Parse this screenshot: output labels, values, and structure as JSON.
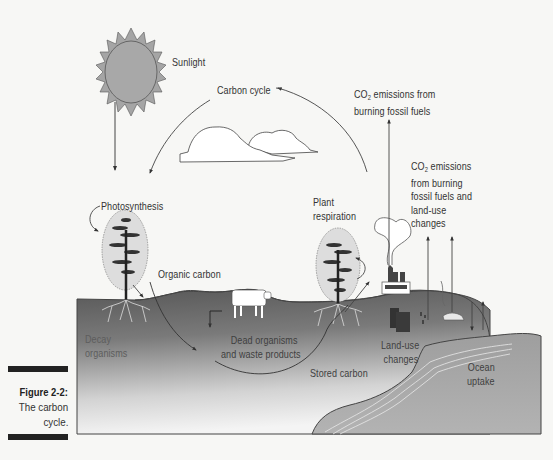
{
  "figure": {
    "number_label": "Figure 2-2:",
    "caption_line1": "The carbon",
    "caption_line2": "cycle."
  },
  "labels": {
    "sunlight": "Sunlight",
    "carbon_cycle": "Carbon cycle",
    "co2_fossil_line1_prefix": "CO",
    "co2_fossil_line1_sub": "2",
    "co2_fossil_line1_suffix": " emissions from",
    "co2_fossil_line2": "burning fossil fuels",
    "co2_landuse_line1_prefix": "CO",
    "co2_landuse_line1_sub": "2",
    "co2_landuse_line1_suffix": " emissions",
    "co2_landuse_line2": "from burning",
    "co2_landuse_line3": "fossil fuels and",
    "co2_landuse_line4": "land-use",
    "co2_landuse_line5": "changes",
    "photosynthesis": "Photosynthesis",
    "plant_respiration_line1": "Plant",
    "plant_respiration_line2": "respiration",
    "organic_carbon": "Organic carbon",
    "decay_line1": "Decay",
    "decay_line2": "organisms",
    "dead_organisms_line1": "Dead organisms",
    "dead_organisms_line2": "and waste products",
    "stored_carbon": "Stored carbon",
    "land_use_line1": "Land-use",
    "land_use_line2": "changes",
    "ocean_line1": "Ocean",
    "ocean_line2": "uptake"
  },
  "colors": {
    "sun_fill": "#a8a8a8",
    "ground_top": "#5e5e5e",
    "ground_bottom": "#f2f2f2",
    "ocean": "#a9a9a9",
    "caption_bar": "#222222"
  }
}
